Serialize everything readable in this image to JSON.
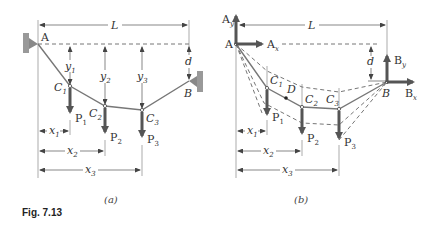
{
  "figure": {
    "caption": "Fig. 7.13",
    "panels": [
      {
        "id": "a",
        "label": "(a)",
        "points": {
          "A": "A",
          "B": "B",
          "C1": "C",
          "C2": "C",
          "C3": "C"
        },
        "dims": {
          "L": "L",
          "d": "d",
          "y": "y",
          "x": "x"
        },
        "forces": {
          "P": "P"
        },
        "subs": {
          "1": "1",
          "2": "2",
          "3": "3"
        }
      },
      {
        "id": "b",
        "label": "(b)",
        "points": {
          "A": "A",
          "B": "B",
          "C": "C",
          "D": "D"
        },
        "dims": {
          "L": "L",
          "d": "d",
          "x": "x"
        },
        "forces": {
          "P": "P",
          "Ax": "A",
          "Ay": "A",
          "Bx": "B",
          "By": "B",
          "x_sub": "x",
          "y_sub": "y"
        },
        "subs": {
          "1": "1",
          "2": "2",
          "3": "3"
        }
      }
    ]
  }
}
